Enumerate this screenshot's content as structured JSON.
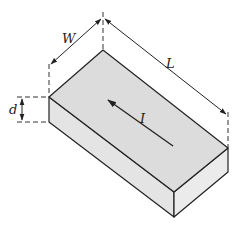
{
  "diagram": {
    "colors": {
      "top_face": "#dcdcdc",
      "side_face": "#e4e4e4",
      "front_face": "#e9e9e9",
      "edge": "#222222",
      "dim_line": "#333333"
    },
    "labels": {
      "width": "W",
      "length": "L",
      "thickness": "d",
      "current": "I"
    },
    "dimensions": [
      {
        "name": "width",
        "symbol": "W",
        "type": "double-arrow"
      },
      {
        "name": "length",
        "symbol": "L",
        "type": "double-arrow"
      },
      {
        "name": "thickness",
        "symbol": "d",
        "type": "double-arrow"
      }
    ],
    "current_arrow": {
      "symbol": "I",
      "direction": "toward back-left along length"
    }
  }
}
